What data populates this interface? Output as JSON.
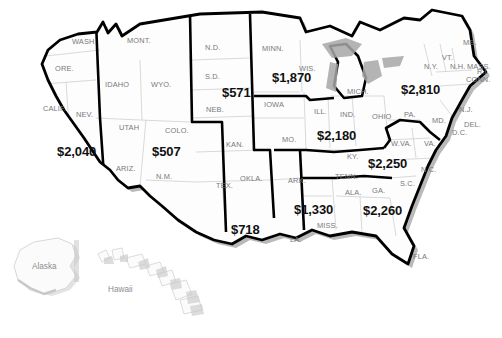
{
  "map": {
    "title": "United States regional values map",
    "colors": {
      "background": "#ffffff",
      "land_fill": "#fdfdfd",
      "state_border": "#cfcfcf",
      "region_border": "#000000",
      "outer_border": "#000000",
      "shadow": "#b9b9b9",
      "lake_fill": "#a8a8a8",
      "inset_fill": "#fbfbfb",
      "inset_border": "#d8d8d8",
      "inset_shadow": "#c8c8c8",
      "state_label_color": "#77787b",
      "value_label_color": "#111111"
    },
    "regions": [
      {
        "name": "pacific-west",
        "value": "$2,040",
        "x": 57,
        "y": 144
      },
      {
        "name": "mountain-west",
        "value": "$507",
        "x": 152,
        "y": 144
      },
      {
        "name": "west-north-central",
        "value": "$571",
        "x": 222,
        "y": 85
      },
      {
        "name": "east-north-central-upper",
        "value": "$1,870",
        "x": 272,
        "y": 70
      },
      {
        "name": "east-north-central",
        "value": "$2,180",
        "x": 317,
        "y": 128
      },
      {
        "name": "mid-atlantic",
        "value": "$2,810",
        "x": 401,
        "y": 82
      },
      {
        "name": "south-atlantic-upper",
        "value": "$2,250",
        "x": 368,
        "y": 156
      },
      {
        "name": "south-atlantic-lower",
        "value": "$2,260",
        "x": 363,
        "y": 203
      },
      {
        "name": "east-south-central",
        "value": "$1,330",
        "x": 294,
        "y": 202
      },
      {
        "name": "west-south-central",
        "value": "$718",
        "x": 231,
        "y": 222
      }
    ],
    "states": [
      {
        "abbr": "WASH.",
        "x": 72,
        "y": 37
      },
      {
        "abbr": "MONT.",
        "x": 127,
        "y": 36
      },
      {
        "abbr": "N.D.",
        "x": 205,
        "y": 43
      },
      {
        "abbr": "MINN.",
        "x": 262,
        "y": 44
      },
      {
        "abbr": "ORE.",
        "x": 55,
        "y": 64
      },
      {
        "abbr": "IDAHO",
        "x": 105,
        "y": 80
      },
      {
        "abbr": "WYO.",
        "x": 151,
        "y": 80
      },
      {
        "abbr": "S.D.",
        "x": 205,
        "y": 72
      },
      {
        "abbr": "WIS.",
        "x": 299,
        "y": 64
      },
      {
        "abbr": "MICH.",
        "x": 347,
        "y": 87
      },
      {
        "abbr": "ME.",
        "x": 463,
        "y": 38
      },
      {
        "abbr": "VT.",
        "x": 442,
        "y": 53
      },
      {
        "abbr": "N.H.",
        "x": 450,
        "y": 62
      },
      {
        "abbr": "MASS.",
        "x": 467,
        "y": 62
      },
      {
        "abbr": "N.Y.",
        "x": 424,
        "y": 62
      },
      {
        "abbr": "CALIF.",
        "x": 43,
        "y": 104
      },
      {
        "abbr": "NEV.",
        "x": 76,
        "y": 110
      },
      {
        "abbr": "UTAH",
        "x": 119,
        "y": 123
      },
      {
        "abbr": "COLO.",
        "x": 165,
        "y": 126
      },
      {
        "abbr": "NEB.",
        "x": 206,
        "y": 105
      },
      {
        "abbr": "IOWA",
        "x": 264,
        "y": 100
      },
      {
        "abbr": "ILL.",
        "x": 314,
        "y": 107
      },
      {
        "abbr": "IND.",
        "x": 340,
        "y": 110
      },
      {
        "abbr": "OHIO",
        "x": 372,
        "y": 112
      },
      {
        "abbr": "PA.",
        "x": 404,
        "y": 110
      },
      {
        "abbr": "CONN.",
        "x": 466,
        "y": 75
      },
      {
        "abbr": "R.I.",
        "x": 477,
        "y": 67
      },
      {
        "abbr": "N.J.",
        "x": 459,
        "y": 105
      },
      {
        "abbr": "DEL.",
        "x": 464,
        "y": 120
      },
      {
        "abbr": "MD.",
        "x": 432,
        "y": 116
      },
      {
        "abbr": "D.C.",
        "x": 452,
        "y": 128
      },
      {
        "abbr": "KAN.",
        "x": 226,
        "y": 140
      },
      {
        "abbr": "MO.",
        "x": 282,
        "y": 135
      },
      {
        "abbr": "W.VA.",
        "x": 391,
        "y": 139
      },
      {
        "abbr": "VA.",
        "x": 424,
        "y": 139
      },
      {
        "abbr": "KY.",
        "x": 347,
        "y": 152
      },
      {
        "abbr": "ARIZ.",
        "x": 116,
        "y": 164
      },
      {
        "abbr": "N.M.",
        "x": 156,
        "y": 172
      },
      {
        "abbr": "OKLA.",
        "x": 240,
        "y": 174
      },
      {
        "abbr": "TEX.",
        "x": 216,
        "y": 181
      },
      {
        "abbr": "ARK.",
        "x": 288,
        "y": 176
      },
      {
        "abbr": "TENN.",
        "x": 335,
        "y": 172
      },
      {
        "abbr": "N.C.",
        "x": 421,
        "y": 165
      },
      {
        "abbr": "S.C.",
        "x": 400,
        "y": 179
      },
      {
        "abbr": "GA.",
        "x": 372,
        "y": 186
      },
      {
        "abbr": "ALA.",
        "x": 345,
        "y": 188
      },
      {
        "abbr": "MISS.",
        "x": 317,
        "y": 221
      },
      {
        "abbr": "LA.",
        "x": 290,
        "y": 235
      },
      {
        "abbr": "FLA.",
        "x": 413,
        "y": 252
      }
    ],
    "insets": [
      {
        "name": "alaska",
        "label": "Alaska",
        "x": 32,
        "y": 262
      },
      {
        "name": "hawaii",
        "label": "Hawaii",
        "x": 108,
        "y": 285
      }
    ]
  }
}
